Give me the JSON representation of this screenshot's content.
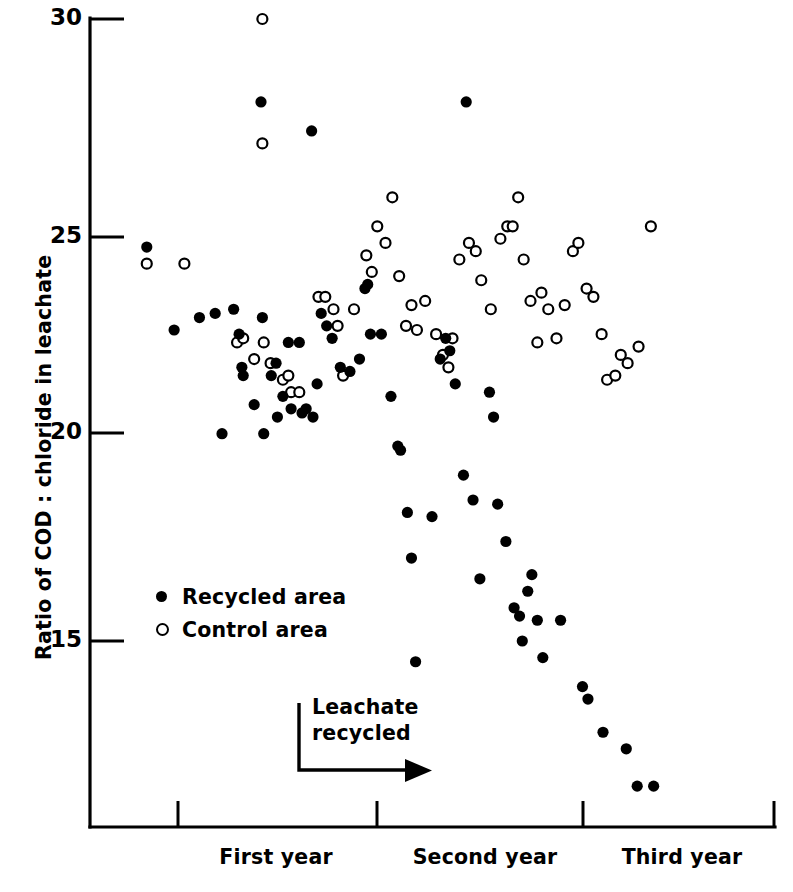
{
  "chart_data": {
    "type": "scatter",
    "title": "",
    "xlabel": "",
    "ylabel": "Ratio of COD : chloride in leachate",
    "ylim": [
      11.4,
      30.0
    ],
    "xlim": [
      0,
      100
    ],
    "grid": false,
    "legend_position": "inside-lower-left",
    "yticks": [
      15,
      20,
      25,
      30
    ],
    "ytick_labels": [
      "15",
      "20",
      "25",
      "30"
    ],
    "xtick_labels": [
      "First year",
      "Second year",
      "Third year"
    ],
    "xtick_positions": [
      25,
      54,
      80
    ],
    "x_axis_tick_marks": [
      12.5,
      41.5,
      70,
      99
    ],
    "annotations": [
      {
        "text_line1": "Leachate",
        "text_line2": "recycled",
        "marker": "L-shaped arrow pointing right"
      }
    ],
    "series": [
      {
        "name": "Recycled area",
        "marker": "filled-circle",
        "color": "#000000",
        "points": [
          [
            8.3,
            24.5
          ],
          [
            12.3,
            22.5
          ],
          [
            16.0,
            22.8
          ],
          [
            18.3,
            22.9
          ],
          [
            19.3,
            20.0
          ],
          [
            21.0,
            23.0
          ],
          [
            21.8,
            22.4
          ],
          [
            22.2,
            21.6
          ],
          [
            22.4,
            21.4
          ],
          [
            24.0,
            20.7
          ],
          [
            25.0,
            28.0
          ],
          [
            25.2,
            22.8
          ],
          [
            25.4,
            20.0
          ],
          [
            26.5,
            21.4
          ],
          [
            27.2,
            21.7
          ],
          [
            27.4,
            20.4
          ],
          [
            28.2,
            20.9
          ],
          [
            29.0,
            22.2
          ],
          [
            29.4,
            20.6
          ],
          [
            30.6,
            22.2
          ],
          [
            31.0,
            20.5
          ],
          [
            31.6,
            20.6
          ],
          [
            32.4,
            27.3
          ],
          [
            32.6,
            20.4
          ],
          [
            33.2,
            21.2
          ],
          [
            33.8,
            22.9
          ],
          [
            34.6,
            22.6
          ],
          [
            35.4,
            22.3
          ],
          [
            36.6,
            21.6
          ],
          [
            38.0,
            21.5
          ],
          [
            39.4,
            21.8
          ],
          [
            40.2,
            23.5
          ],
          [
            40.6,
            23.6
          ],
          [
            41.0,
            22.4
          ],
          [
            42.6,
            22.4
          ],
          [
            44.0,
            20.9
          ],
          [
            45.0,
            19.7
          ],
          [
            45.4,
            19.6
          ],
          [
            46.4,
            18.1
          ],
          [
            47.0,
            17.0
          ],
          [
            47.6,
            14.5
          ],
          [
            50.0,
            18.0
          ],
          [
            51.2,
            21.8
          ],
          [
            52.0,
            22.3
          ],
          [
            52.6,
            22.0
          ],
          [
            53.4,
            21.2
          ],
          [
            54.6,
            19.0
          ],
          [
            55.0,
            28.0
          ],
          [
            56.0,
            18.4
          ],
          [
            57.0,
            16.5
          ],
          [
            58.4,
            21.0
          ],
          [
            59.0,
            20.4
          ],
          [
            59.6,
            18.3
          ],
          [
            60.8,
            17.4
          ],
          [
            62.0,
            15.8
          ],
          [
            62.8,
            15.6
          ],
          [
            63.2,
            15.0
          ],
          [
            64.0,
            16.2
          ],
          [
            64.6,
            16.6
          ],
          [
            65.4,
            15.5
          ],
          [
            66.2,
            14.6
          ],
          [
            68.8,
            15.5
          ],
          [
            72.0,
            13.9
          ],
          [
            72.8,
            13.6
          ],
          [
            75.0,
            12.8
          ],
          [
            78.4,
            12.4
          ],
          [
            80.0,
            11.5
          ],
          [
            82.4,
            11.5
          ]
        ]
      },
      {
        "name": "Control area",
        "marker": "open-circle",
        "color": "#000000",
        "points": [
          [
            8.3,
            24.1
          ],
          [
            13.8,
            24.1
          ],
          [
            21.5,
            22.2
          ],
          [
            22.4,
            22.3
          ],
          [
            24.0,
            21.8
          ],
          [
            25.2,
            30.0
          ],
          [
            25.2,
            27.0
          ],
          [
            25.4,
            22.2
          ],
          [
            26.4,
            21.7
          ],
          [
            28.2,
            21.3
          ],
          [
            29.0,
            21.4
          ],
          [
            29.4,
            21.0
          ],
          [
            30.6,
            21.0
          ],
          [
            33.4,
            23.3
          ],
          [
            34.4,
            23.3
          ],
          [
            35.6,
            23.0
          ],
          [
            36.2,
            22.6
          ],
          [
            37.0,
            21.4
          ],
          [
            38.6,
            23.0
          ],
          [
            40.4,
            24.3
          ],
          [
            41.2,
            23.9
          ],
          [
            42.0,
            25.0
          ],
          [
            43.2,
            24.6
          ],
          [
            44.2,
            25.7
          ],
          [
            45.2,
            23.8
          ],
          [
            46.2,
            22.6
          ],
          [
            47.0,
            23.1
          ],
          [
            47.8,
            22.5
          ],
          [
            49.0,
            23.2
          ],
          [
            50.6,
            22.4
          ],
          [
            51.6,
            21.9
          ],
          [
            52.4,
            21.6
          ],
          [
            53.0,
            22.3
          ],
          [
            54.0,
            24.2
          ],
          [
            55.4,
            24.6
          ],
          [
            56.4,
            24.4
          ],
          [
            57.2,
            23.7
          ],
          [
            58.6,
            23.0
          ],
          [
            60.0,
            24.7
          ],
          [
            61.0,
            25.0
          ],
          [
            61.8,
            25.0
          ],
          [
            62.6,
            25.7
          ],
          [
            63.4,
            24.2
          ],
          [
            64.4,
            23.2
          ],
          [
            65.4,
            22.2
          ],
          [
            66.0,
            23.4
          ],
          [
            67.0,
            23.0
          ],
          [
            68.2,
            22.3
          ],
          [
            69.4,
            23.1
          ],
          [
            70.6,
            24.4
          ],
          [
            71.4,
            24.6
          ],
          [
            72.6,
            23.5
          ],
          [
            73.6,
            23.3
          ],
          [
            74.8,
            22.4
          ],
          [
            75.6,
            21.3
          ],
          [
            76.8,
            21.4
          ],
          [
            77.6,
            21.9
          ],
          [
            78.6,
            21.7
          ],
          [
            80.2,
            22.1
          ],
          [
            82.0,
            25.0
          ]
        ]
      }
    ]
  },
  "legend": {
    "items": [
      {
        "label": "Recycled area",
        "marker": "filled-circle"
      },
      {
        "label": "Control area",
        "marker": "open-circle"
      }
    ]
  },
  "annotation": {
    "line1": "Leachate",
    "line2": "recycled"
  },
  "axis": {
    "y_label": "Ratio of COD : chloride in leachate",
    "y_tick_30": "30",
    "y_tick_25": "25",
    "y_tick_20": "20",
    "y_tick_15": "15",
    "x_label_1": "First year",
    "x_label_2": "Second year",
    "x_label_3": "Third year"
  }
}
